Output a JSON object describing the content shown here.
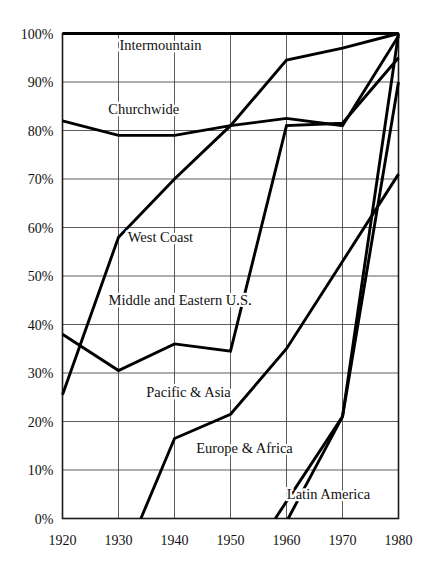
{
  "chart_data": {
    "type": "line",
    "title": "",
    "subtitle": "",
    "xlabel": "",
    "ylabel": "",
    "xlim": [
      1920,
      1980
    ],
    "ylim": [
      0,
      100
    ],
    "grid": true,
    "legend_position": "inline-labels",
    "x": [
      1920,
      1930,
      1940,
      1950,
      1960,
      1970,
      1980
    ],
    "xticklabels": [
      "1920",
      "1930",
      "1940",
      "1950",
      "1960",
      "1970",
      "1980"
    ],
    "yticks": [
      0,
      10,
      20,
      30,
      40,
      50,
      60,
      70,
      80,
      90,
      100
    ],
    "yticklabels": [
      "0%",
      "10%",
      "20%",
      "30%",
      "40%",
      "50%",
      "60%",
      "70%",
      "80%",
      "90%",
      "100%"
    ],
    "series": [
      {
        "name": "Intermountain",
        "label": "Intermountain",
        "label_x": 1937.5,
        "label_y": 96.5,
        "points": [
          [
            1920,
            100
          ],
          [
            1930,
            100
          ],
          [
            1940,
            100
          ],
          [
            1950,
            100
          ],
          [
            1960,
            100
          ],
          [
            1970,
            100
          ],
          [
            1980,
            100
          ]
        ]
      },
      {
        "name": "Churchwide",
        "label": "Churchwide",
        "label_x": 1934.5,
        "label_y": 83.5,
        "points": [
          [
            1920,
            82
          ],
          [
            1930,
            79
          ],
          [
            1940,
            79
          ],
          [
            1950,
            81
          ],
          [
            1960,
            82.5
          ],
          [
            1970,
            81
          ],
          [
            1980,
            99.5
          ]
        ]
      },
      {
        "name": "West Coast",
        "label": "West Coast",
        "label_x": 1937.5,
        "label_y": 57,
        "points": [
          [
            1920,
            25.5
          ],
          [
            1930,
            58
          ],
          [
            1940,
            70
          ],
          [
            1950,
            81
          ],
          [
            1960,
            94.5
          ],
          [
            1970,
            97
          ],
          [
            1980,
            100
          ]
        ]
      },
      {
        "name": "Middle and Eastern U.S.",
        "label": "Middle and Eastern U.S.",
        "label_x": 1941,
        "label_y": 44,
        "points": [
          [
            1920,
            38
          ],
          [
            1930,
            30.5
          ],
          [
            1940,
            36
          ],
          [
            1950,
            34.5
          ],
          [
            1960,
            81
          ],
          [
            1970,
            81.5
          ],
          [
            1980,
            95
          ]
        ]
      },
      {
        "name": "Pacific & Asia",
        "label": "Pacific & Asia",
        "label_x": 1942.5,
        "label_y": 25,
        "points": [
          [
            1934,
            0
          ],
          [
            1940,
            16.5
          ],
          [
            1950,
            21.5
          ],
          [
            1960,
            35
          ],
          [
            1970,
            53
          ],
          [
            1980,
            71
          ]
        ]
      },
      {
        "name": "Europe & Africa",
        "label": "Europe & Africa",
        "label_x": 1952.5,
        "label_y": 13.5,
        "points": [
          [
            1958,
            0
          ],
          [
            1970,
            21
          ],
          [
            1980,
            90
          ]
        ]
      },
      {
        "name": "Latin America",
        "label": "Latin America",
        "label_x": 1967.5,
        "label_y": 4,
        "points": [
          [
            1960.3,
            0
          ],
          [
            1970,
            21
          ],
          [
            1980,
            100
          ]
        ]
      }
    ]
  }
}
